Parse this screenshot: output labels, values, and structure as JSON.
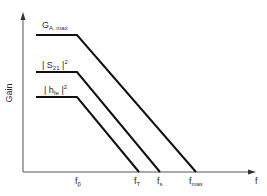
{
  "diagram": {
    "y_axis_label": "Gain",
    "x_axis_label": "f",
    "curves": [
      {
        "name": "G",
        "subscript": "A, max",
        "superscript": "",
        "prefix": "",
        "suffix": ""
      },
      {
        "name": "S",
        "subscript": "21",
        "superscript": "2",
        "prefix": "| ",
        "suffix": " |"
      },
      {
        "name": "h",
        "subscript": "fe",
        "superscript": "2",
        "prefix": "| ",
        "suffix": " |"
      }
    ],
    "x_ticks": [
      {
        "name": "f",
        "subscript": "β"
      },
      {
        "name": "f",
        "subscript": "T"
      },
      {
        "name": "f",
        "subscript": "s"
      },
      {
        "name": "f",
        "subscript": "max"
      }
    ],
    "colors": {
      "line": "#111111",
      "axis": "#555555",
      "text": "#2a2a2a"
    }
  }
}
